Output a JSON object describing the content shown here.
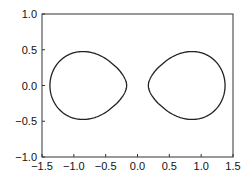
{
  "chart_data": {
    "type": "line",
    "title": "",
    "xlabel": "",
    "ylabel": "",
    "xlim": [
      -1.5,
      1.5
    ],
    "ylim": [
      -1.0,
      1.0
    ],
    "grid": false,
    "legend": null,
    "x_ticks": [
      -1.5,
      -1.0,
      -0.5,
      0.0,
      0.5,
      1.0,
      1.5
    ],
    "x_tick_labels": [
      "−1.5",
      "−1.0",
      "−0.5",
      "0.0",
      "0.5",
      "1.0",
      "1.5"
    ],
    "y_ticks": [
      -1.0,
      -0.5,
      0.0,
      0.5,
      1.0
    ],
    "y_tick_labels": [
      "−1.0",
      "−0.5",
      "0.0",
      "0.5",
      "1.0"
    ],
    "curve": {
      "description": "Two-lobed closed curve (Cassini oval with b < a), symmetric about both axes",
      "equation": "((x-a)^2+y^2)((x+a)^2+y^2) = b^4",
      "a": 0.98,
      "b": 0.965,
      "color": "#222222",
      "lobes": [
        {
          "x_range": [
            -1.38,
            -0.12
          ],
          "y_range": [
            -0.5,
            0.5
          ],
          "peak_x": -0.85
        },
        {
          "x_range": [
            0.12,
            1.38
          ],
          "y_range": [
            -0.5,
            0.5
          ],
          "peak_x": 0.85
        }
      ]
    }
  }
}
